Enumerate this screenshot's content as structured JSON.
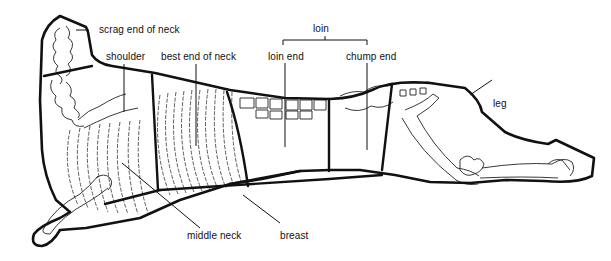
{
  "diagram": {
    "colors": {
      "outline": "#111111",
      "bone": "#333333",
      "background": "#ffffff"
    },
    "labels": {
      "scrag_end_of_neck": "scrag end of neck",
      "shoulder": "shoulder",
      "best_end_of_neck": "best end of neck",
      "loin_group": "loin",
      "loin_end": "loin end",
      "chump_end": "chump end",
      "leg": "leg",
      "middle_neck": "middle neck",
      "breast": "breast"
    },
    "cuts": [
      "scrag end of neck",
      "shoulder",
      "best end of neck",
      "loin end",
      "chump end",
      "leg",
      "middle neck",
      "breast"
    ]
  }
}
